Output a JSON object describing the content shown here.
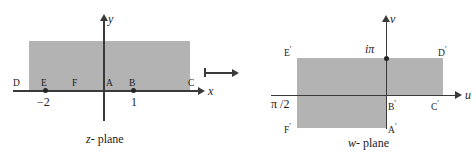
{
  "figure": {
    "type": "complex-plane-mapping-diagram",
    "mapping_arrow": "right-arrow"
  },
  "z_plane": {
    "caption_var": "z",
    "caption_text": "- plane",
    "axis_x_label": "x",
    "axis_y_label": "y",
    "points": [
      {
        "id": "D",
        "label": "D"
      },
      {
        "id": "E",
        "label": "E",
        "value": "−2"
      },
      {
        "id": "F",
        "label": "F"
      },
      {
        "id": "A",
        "label": "A"
      },
      {
        "id": "B",
        "label": "B",
        "value": "1"
      },
      {
        "id": "C",
        "label": "C"
      }
    ]
  },
  "w_plane": {
    "caption_var": "w",
    "caption_text": "- plane",
    "axis_u_label": "u",
    "axis_v_label": "v",
    "marks": [
      {
        "id": "i-pi",
        "label": "iπ"
      },
      {
        "id": "pi-over-2",
        "label": "π /2"
      }
    ],
    "points": [
      {
        "id": "E-prime",
        "label": "E",
        "prime": "′"
      },
      {
        "id": "D-prime",
        "label": "D",
        "prime": "′"
      },
      {
        "id": "F-prime",
        "label": "F",
        "prime": "′"
      },
      {
        "id": "B-prime",
        "label": "B",
        "prime": "′"
      },
      {
        "id": "C-prime",
        "label": "C",
        "prime": "′"
      },
      {
        "id": "A-prime",
        "label": "A",
        "prime": "′"
      }
    ]
  },
  "colors": {
    "shade": "#b3b3b3",
    "ink": "#1c1c1c",
    "axis": "#3a3a3a"
  }
}
